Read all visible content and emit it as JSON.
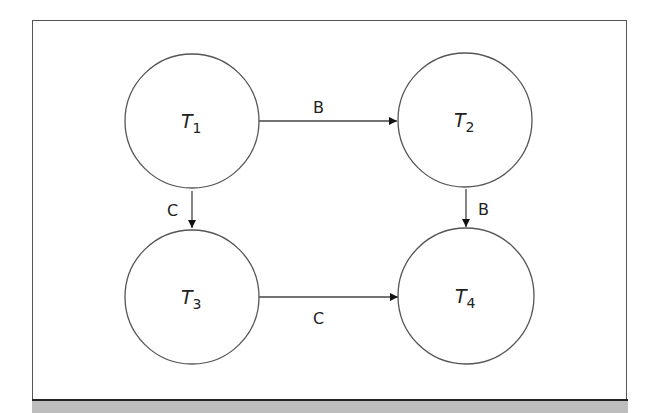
{
  "diagram": {
    "nodes": [
      {
        "id": "T1",
        "label": "T",
        "sub": "1"
      },
      {
        "id": "T2",
        "label": "T",
        "sub": "2"
      },
      {
        "id": "T3",
        "label": "T",
        "sub": "3"
      },
      {
        "id": "T4",
        "label": "T",
        "sub": "4"
      }
    ],
    "edges": [
      {
        "from": "T1",
        "to": "T2",
        "label": "B"
      },
      {
        "from": "T1",
        "to": "T3",
        "label": "C"
      },
      {
        "from": "T2",
        "to": "T4",
        "label": "B"
      },
      {
        "from": "T3",
        "to": "T4",
        "label": "C"
      }
    ],
    "colors": {
      "stroke": "#555555",
      "band": "#bdbdbd"
    }
  }
}
